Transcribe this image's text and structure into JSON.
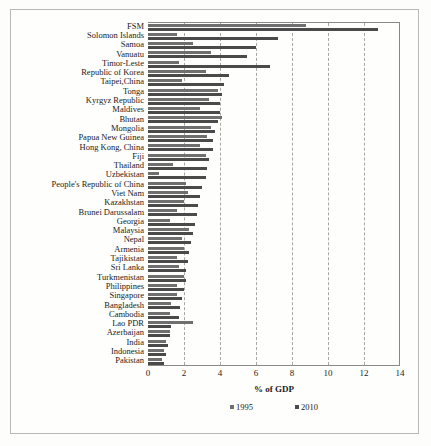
{
  "chart_data": {
    "type": "bar",
    "orientation": "horizontal",
    "title": "",
    "xlabel": "% of GDP",
    "ylabel": "",
    "xlim": [
      0,
      14
    ],
    "xticks": [
      0,
      2,
      4,
      6,
      8,
      10,
      12,
      14
    ],
    "grid": "vertical-dashed",
    "legend_position": "bottom",
    "colors": {
      "1995": "#6f6f6f",
      "2010": "#4a4a4a"
    },
    "categories": [
      "FSM",
      "Solomon Islands",
      "Samoa",
      "Vanuatu",
      "Timor-Leste",
      "Republic of Korea",
      "Taipei,China",
      "Tonga",
      "Kyrgyz Republic",
      "Maldives",
      "Bhutan",
      "Mongolia",
      "Papua New Guinea",
      "Hong Kong, China",
      "Fiji",
      "Thailand",
      "Uzbekistan",
      "People's Republic of China",
      "Viet Nam",
      "Kazakhstan",
      "Brunei Darussalam",
      "Georgia",
      "Malaysia",
      "Nepal",
      "Armenia",
      "Tajikistan",
      "Sri Lanka",
      "Turkmenistan",
      "Philippines",
      "Singapore",
      "Bangladesh",
      "Cambodia",
      "Lao PDR",
      "Azerbaijan",
      "India",
      "Indonesia",
      "Pakistan"
    ],
    "series": [
      {
        "name": "1995",
        "values": [
          8.8,
          1.6,
          2.5,
          3.5,
          1.7,
          3.2,
          1.9,
          3.9,
          3.4,
          2.9,
          4.1,
          3.5,
          3.3,
          2.9,
          3.2,
          1.4,
          0.6,
          2.1,
          2.2,
          2.0,
          1.6,
          1.2,
          2.3,
          1.9,
          2.0,
          1.6,
          1.7,
          2.0,
          1.6,
          1.6,
          1.3,
          1.2,
          2.5,
          1.2,
          1.0,
          0.9,
          0.8
        ]
      },
      {
        "name": "2010",
        "values": [
          12.8,
          7.2,
          6.0,
          5.5,
          6.8,
          4.5,
          4.2,
          4.1,
          4.0,
          4.0,
          3.9,
          3.7,
          3.6,
          3.6,
          3.4,
          3.3,
          3.2,
          3.0,
          2.9,
          2.8,
          2.7,
          2.6,
          2.5,
          2.4,
          2.3,
          2.2,
          2.1,
          2.1,
          2.0,
          1.9,
          1.8,
          1.7,
          1.3,
          1.2,
          1.1,
          1.0,
          0.9
        ]
      }
    ],
    "legend": [
      {
        "label": "1995",
        "color": "#6f6f6f"
      },
      {
        "label": "2010",
        "color": "#4a4a4a"
      }
    ]
  }
}
